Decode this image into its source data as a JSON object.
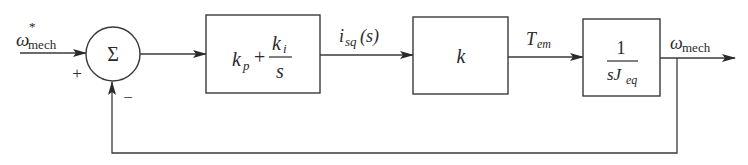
{
  "diagram": {
    "type": "block-diagram",
    "input_signal": {
      "symbol": "ω",
      "superscript": "*",
      "subscript": "mech"
    },
    "summing_junction": {
      "symbol": "Σ",
      "plus_sign": "+",
      "minus_sign": "−"
    },
    "blocks": [
      {
        "id": "pi-controller",
        "numerator_left": "k",
        "numerator_left_sub": "p",
        "plus": "+",
        "frac_num": "k",
        "frac_num_sub": "i",
        "frac_den": "s"
      },
      {
        "id": "torque-constant",
        "label": "k"
      },
      {
        "id": "mechanical-plant",
        "frac_num": "1",
        "frac_den": "sJ",
        "frac_den_sub": "eq"
      }
    ],
    "signals": [
      {
        "id": "current",
        "symbol": "i",
        "subscript": "sq",
        "suffix": " (s)"
      },
      {
        "id": "torque",
        "symbol": "T",
        "subscript": "em"
      },
      {
        "id": "output",
        "symbol": "ω",
        "subscript": "mech"
      }
    ],
    "feedback": "unity negative feedback from ω_mech to summing junction"
  }
}
